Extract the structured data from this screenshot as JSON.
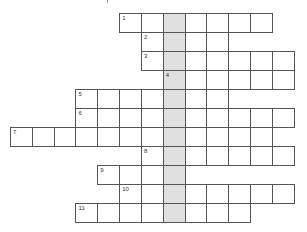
{
  "puzzle": {
    "type": "crossword",
    "highlight_color": "#e0e0e0",
    "line_color": "#555555",
    "highlight_column": 7,
    "geometry": {
      "origin_x": 10,
      "origin_y": 13,
      "cell_w": 21.83,
      "cell_h": 19
    },
    "rows": [
      {
        "clue": "1",
        "row": 0,
        "start_col": 5,
        "end_col": 11
      },
      {
        "clue": "2",
        "row": 1,
        "start_col": 6,
        "end_col": 9
      },
      {
        "clue": "3",
        "row": 2,
        "start_col": 6,
        "end_col": 12
      },
      {
        "clue": "4",
        "row": 3,
        "start_col": 7,
        "end_col": 12
      },
      {
        "clue": "5",
        "row": 4,
        "start_col": 3,
        "end_col": 9
      },
      {
        "clue": "6",
        "row": 5,
        "start_col": 3,
        "end_col": 12
      },
      {
        "clue": "7",
        "row": 6,
        "start_col": 0,
        "end_col": 11
      },
      {
        "clue": "8",
        "row": 7,
        "start_col": 6,
        "end_col": 12
      },
      {
        "clue": "9",
        "row": 8,
        "start_col": 4,
        "end_col": 7
      },
      {
        "clue": "10",
        "row": 9,
        "start_col": 5,
        "end_col": 12
      },
      {
        "clue": "11",
        "row": 10,
        "start_col": 3,
        "end_col": 10
      }
    ]
  }
}
